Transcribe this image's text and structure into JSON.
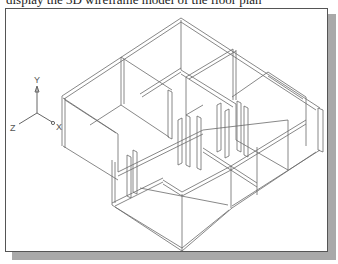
{
  "caption": "display the 3D wireframe model of the floor plan",
  "viewport": {
    "title": "3D wireframe view",
    "background": "#ffffff",
    "border_color": "#555555",
    "shadow_color": "#a9a9a9"
  },
  "ucs_icon": {
    "axes": [
      {
        "label": "Y"
      },
      {
        "label": "Z"
      },
      {
        "label": "X"
      }
    ]
  },
  "model": {
    "type": "isometric wireframe",
    "description": "Floor plan walls with door openings and panels"
  }
}
